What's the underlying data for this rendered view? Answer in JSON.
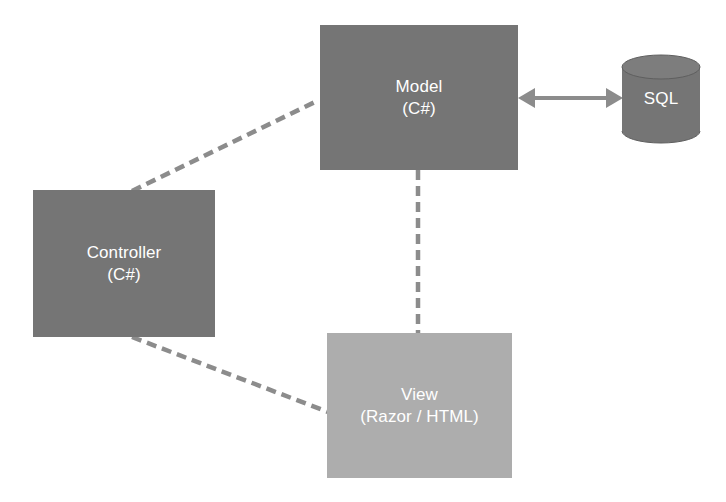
{
  "diagram": {
    "background_color": "#ffffff",
    "nodes": [
      {
        "id": "model",
        "name": "model-node",
        "shape": "rectangle",
        "line_primary": "Model",
        "line_secondary": "(C#)",
        "fill_color": "#757575",
        "text_color": "#ffffff"
      },
      {
        "id": "controller",
        "name": "controller-node",
        "shape": "rectangle",
        "line_primary": "Controller",
        "line_secondary": "(C#)",
        "fill_color": "#757575",
        "text_color": "#ffffff"
      },
      {
        "id": "view",
        "name": "view-node",
        "shape": "rectangle",
        "line_primary": "View",
        "line_secondary": "(Razor / HTML)",
        "fill_color": "#adadad",
        "text_color": "#ffffff"
      },
      {
        "id": "sql",
        "name": "sql-database-node",
        "shape": "cylinder",
        "line_primary": "SQL",
        "line_secondary": "",
        "fill_color": "#757575",
        "text_color": "#ffffff"
      }
    ],
    "connectors": [
      {
        "id": "model-sql",
        "name": "model-to-sql-connector",
        "from": "model",
        "to": "sql",
        "style": "solid",
        "arrow": "double",
        "color": "#8c8c8c"
      },
      {
        "id": "controller-model",
        "name": "controller-to-model-connector",
        "from": "controller",
        "to": "model",
        "style": "dashed",
        "arrow": "none",
        "color": "#8c8c8c"
      },
      {
        "id": "controller-view",
        "name": "controller-to-view-connector",
        "from": "controller",
        "to": "view",
        "style": "dashed",
        "arrow": "none",
        "color": "#8c8c8c"
      },
      {
        "id": "model-view",
        "name": "model-to-view-connector",
        "from": "model",
        "to": "view",
        "style": "dashed",
        "arrow": "none",
        "color": "#8c8c8c"
      }
    ]
  }
}
